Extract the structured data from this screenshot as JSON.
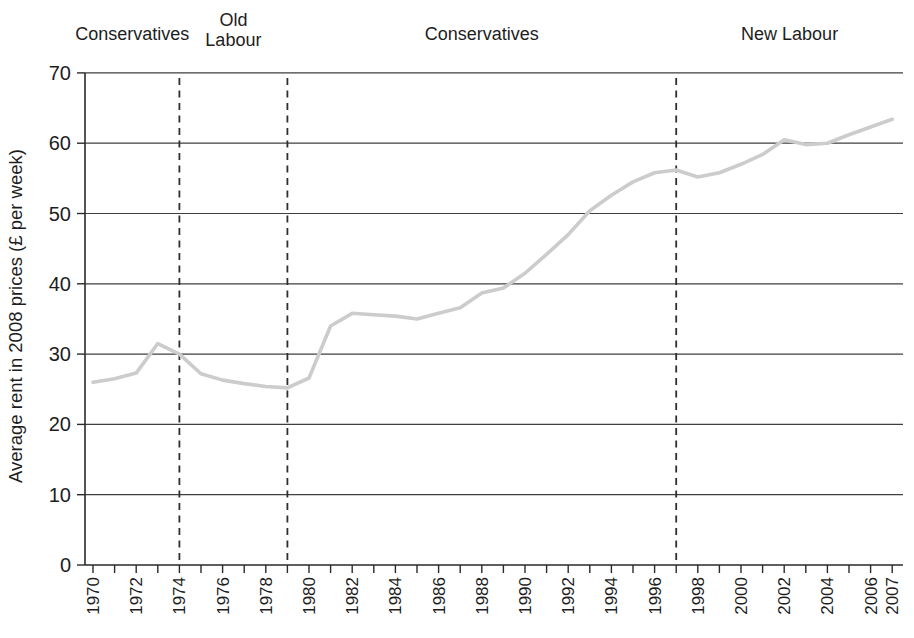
{
  "chart_data": {
    "type": "line",
    "title": "",
    "subtitle": "",
    "xlabel": "",
    "ylabel": "Average rent in 2008 prices (£ per week)",
    "ylim": [
      0,
      70
    ],
    "yticks": [
      0,
      10,
      20,
      30,
      40,
      50,
      60,
      70
    ],
    "grid": "horizontal",
    "legend_position": "none",
    "x": [
      1970,
      1971,
      1972,
      1973,
      1974,
      1975,
      1976,
      1977,
      1978,
      1979,
      1980,
      1981,
      1982,
      1983,
      1984,
      1985,
      1986,
      1987,
      1988,
      1989,
      1990,
      1991,
      1992,
      1993,
      1994,
      1995,
      1996,
      1997,
      1998,
      1999,
      2000,
      2001,
      2002,
      2003,
      2004,
      2005,
      2006,
      2007
    ],
    "xtick_labels": [
      "1970",
      "1972",
      "1974",
      "1976",
      "1978",
      "1980",
      "1982",
      "1984",
      "1986",
      "1988",
      "1990",
      "1992",
      "1994",
      "1996",
      "1998",
      "2000",
      "2002",
      "2004",
      "2006",
      "2007"
    ],
    "series": [
      {
        "name": "Average rent",
        "values": [
          26,
          26.5,
          27.3,
          31.5,
          30,
          27.2,
          26.3,
          25.8,
          25.4,
          25.2,
          26.6,
          34,
          35.8,
          35.6,
          35.4,
          35,
          35.8,
          36.6,
          38.7,
          39.4,
          41.5,
          44.2,
          47,
          50.4,
          52.6,
          54.5,
          55.8,
          56.2,
          55.2,
          55.8,
          57,
          58.4,
          60.5,
          59.8,
          60,
          61.2,
          62.3,
          63.4
        ]
      }
    ],
    "dashed_divider_years": [
      1974,
      1979,
      1997
    ],
    "era_annotations": [
      {
        "label": "Conservatives",
        "from": 1970,
        "to": 1974,
        "lines": [
          "Conservatives"
        ]
      },
      {
        "label": "Old Labour",
        "from": 1974,
        "to": 1979,
        "lines": [
          "Old",
          "Labour"
        ]
      },
      {
        "label": "Conservatives",
        "from": 1979,
        "to": 1997,
        "lines": [
          "Conservatives"
        ]
      },
      {
        "label": "New Labour",
        "from": 1997,
        "to": 2007,
        "lines": [
          "New Labour"
        ]
      }
    ]
  },
  "colors": {
    "background": "#ffffff",
    "line": "#cccccc",
    "grid": "#3f3f3f",
    "axis": "#2a2a2a",
    "text": "#1d1d1d",
    "divider": "#2e2e2e"
  }
}
